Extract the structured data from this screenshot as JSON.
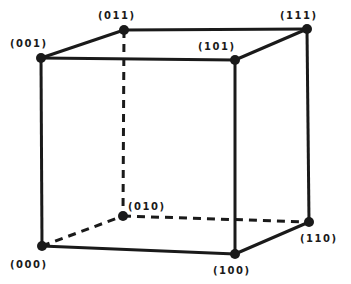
{
  "diagram": {
    "type": "cube",
    "stroke_color": "#1a1a1a",
    "background": "#ffffff",
    "vertices": [
      {
        "id": "000",
        "label": "(000)",
        "x": 42,
        "y": 246,
        "lx": 10,
        "ly": 268
      },
      {
        "id": "001",
        "label": "(001)",
        "x": 41,
        "y": 58,
        "lx": 10,
        "ly": 47
      },
      {
        "id": "010",
        "label": "(010)",
        "x": 123,
        "y": 216,
        "lx": 128,
        "ly": 210
      },
      {
        "id": "011",
        "label": "(011)",
        "x": 124,
        "y": 30,
        "lx": 98,
        "ly": 19
      },
      {
        "id": "100",
        "label": "(100)",
        "x": 235,
        "y": 254,
        "lx": 213,
        "ly": 274
      },
      {
        "id": "101",
        "label": "(101)",
        "x": 235,
        "y": 60,
        "lx": 198,
        "ly": 50
      },
      {
        "id": "110",
        "label": "(110)",
        "x": 309,
        "y": 222,
        "lx": 300,
        "ly": 242
      },
      {
        "id": "111",
        "label": "(111)",
        "x": 307,
        "y": 29,
        "lx": 280,
        "ly": 19
      }
    ],
    "edges": [
      {
        "from": "000",
        "to": "001",
        "style": "solid"
      },
      {
        "from": "000",
        "to": "100",
        "style": "solid"
      },
      {
        "from": "000",
        "to": "010",
        "style": "dashed"
      },
      {
        "from": "001",
        "to": "011",
        "style": "solid"
      },
      {
        "from": "001",
        "to": "101",
        "style": "solid"
      },
      {
        "from": "011",
        "to": "111",
        "style": "solid"
      },
      {
        "from": "011",
        "to": "010",
        "style": "dashed"
      },
      {
        "from": "101",
        "to": "111",
        "style": "solid"
      },
      {
        "from": "101",
        "to": "100",
        "style": "solid"
      },
      {
        "from": "111",
        "to": "110",
        "style": "solid"
      },
      {
        "from": "100",
        "to": "110",
        "style": "solid"
      },
      {
        "from": "010",
        "to": "110",
        "style": "dashed"
      }
    ]
  }
}
